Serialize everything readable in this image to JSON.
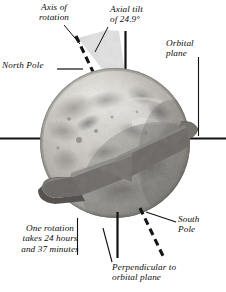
{
  "diagram": {
    "labels": {
      "axis_of_rotation": "Axis of\nrotation",
      "axial_tilt": "Axial tilt\nof 24.9°",
      "north_pole": "North Pole",
      "orbital_plane": "Orbital\nplane",
      "south_pole": "South\nPole",
      "rotation_period": "One rotation\ntakes 24 hours\nand 37 minutes",
      "perpendicular": "Perpendicular to\norbital plane"
    },
    "values": {
      "tilt_degrees": "24.9°",
      "rotation_hours": "24 hours",
      "rotation_minutes": "37 minutes"
    },
    "colors": {
      "background": "#ffffff",
      "text": "#0d0d0d",
      "line": "#111111",
      "dashed_axis": "#1a1a1a",
      "tilt_wedge": "#dedede",
      "sphere_light": "#d6d3cd",
      "sphere_mid": "#b4b0a9",
      "sphere_dark": "#8d8a84",
      "sphere_shadow": "#6f6c67",
      "band": "#6e6c6a",
      "band_dark": "#575553",
      "band_light": "#87847f"
    }
  }
}
